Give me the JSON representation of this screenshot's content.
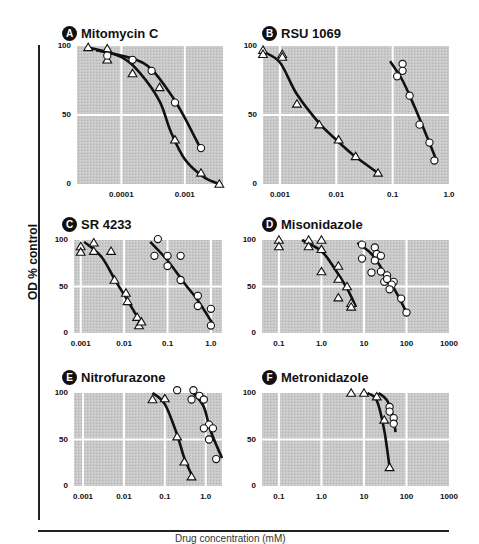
{
  "figure": {
    "y_axis_title": "OD % control",
    "x_axis_title": "Drug concentration (mM)"
  },
  "chart_data": [
    {
      "type": "line",
      "panel": "A",
      "title": "Mitomycin C",
      "xscale": "log",
      "xlim": [
        2e-05,
        0.004
      ],
      "ylim": [
        0,
        100
      ],
      "yticks": [
        "0",
        "50",
        "100"
      ],
      "xticks": [
        "0.0001",
        "0.001"
      ],
      "series": [
        {
          "name": "triangles",
          "marker": "triangle",
          "points": [
            [
              3e-05,
              99
            ],
            [
              6e-05,
              98
            ],
            [
              6e-05,
              90
            ],
            [
              0.00015,
              80
            ],
            [
              0.0004,
              70
            ],
            [
              0.0007,
              32
            ],
            [
              0.0018,
              8
            ],
            [
              0.0035,
              0
            ]
          ],
          "curve": [
            [
              3e-05,
              99
            ],
            [
              0.0001,
              92
            ],
            [
              0.0002,
              80
            ],
            [
              0.0004,
              60
            ],
            [
              0.0006,
              38
            ],
            [
              0.001,
              18
            ],
            [
              0.002,
              5
            ],
            [
              0.0035,
              0
            ]
          ]
        },
        {
          "name": "circles",
          "marker": "circle",
          "points": [
            [
              6e-05,
              93
            ],
            [
              0.00015,
              90
            ],
            [
              0.0003,
              82
            ],
            [
              0.0007,
              59
            ],
            [
              0.0018,
              26
            ]
          ],
          "curve": [
            [
              4e-05,
              97
            ],
            [
              0.00015,
              91
            ],
            [
              0.0003,
              83
            ],
            [
              0.0006,
              65
            ],
            [
              0.001,
              48
            ],
            [
              0.0018,
              25
            ]
          ]
        }
      ]
    },
    {
      "type": "line",
      "panel": "B",
      "title": "RSU 1069",
      "xscale": "log",
      "xlim": [
        0.0005,
        1.0
      ],
      "ylim": [
        0,
        100
      ],
      "yticks": [
        "0",
        "50",
        "100"
      ],
      "xticks": [
        "0.001",
        "0.01",
        "0.1",
        "1.0"
      ],
      "series": [
        {
          "name": "triangles",
          "marker": "triangle",
          "points": [
            [
              0.0005,
              97
            ],
            [
              0.0005,
              94
            ],
            [
              0.0011,
              94
            ],
            [
              0.0011,
              92
            ],
            [
              0.002,
              58
            ],
            [
              0.005,
              43
            ],
            [
              0.011,
              32
            ],
            [
              0.022,
              20
            ],
            [
              0.055,
              8
            ]
          ],
          "curve": [
            [
              0.0005,
              96
            ],
            [
              0.001,
              88
            ],
            [
              0.002,
              65
            ],
            [
              0.005,
              44
            ],
            [
              0.01,
              32
            ],
            [
              0.02,
              21
            ],
            [
              0.055,
              8
            ]
          ]
        },
        {
          "name": "circles",
          "marker": "circle",
          "points": [
            [
              0.12,
              78
            ],
            [
              0.15,
              87
            ],
            [
              0.15,
              82
            ],
            [
              0.2,
              64
            ],
            [
              0.3,
              43
            ],
            [
              0.45,
              30
            ],
            [
              0.55,
              17
            ]
          ],
          "curve": [
            [
              0.09,
              89
            ],
            [
              0.15,
              75
            ],
            [
              0.25,
              55
            ],
            [
              0.4,
              35
            ],
            [
              0.6,
              17
            ]
          ]
        }
      ]
    },
    {
      "type": "line",
      "panel": "C",
      "title": "SR 4233",
      "xscale": "log",
      "xlim": [
        0.0007,
        1.8
      ],
      "ylim": [
        0,
        100
      ],
      "yticks": [
        "0",
        "50",
        "100"
      ],
      "xticks": [
        "0.001",
        "0.01",
        "0.1",
        "1.0"
      ],
      "series": [
        {
          "name": "triangles",
          "marker": "triangle",
          "points": [
            [
              0.001,
              93
            ],
            [
              0.001,
              87
            ],
            [
              0.002,
              97
            ],
            [
              0.002,
              88
            ],
            [
              0.005,
              88
            ],
            [
              0.006,
              57
            ],
            [
              0.011,
              43
            ],
            [
              0.012,
              34
            ],
            [
              0.02,
              17
            ],
            [
              0.022,
              8
            ],
            [
              0.025,
              12
            ]
          ],
          "curve": [
            [
              0.0012,
              98
            ],
            [
              0.003,
              82
            ],
            [
              0.006,
              58
            ],
            [
              0.012,
              35
            ],
            [
              0.025,
              10
            ]
          ]
        },
        {
          "name": "circles",
          "marker": "circle",
          "points": [
            [
              0.06,
              101
            ],
            [
              0.05,
              83
            ],
            [
              0.1,
              83
            ],
            [
              0.1,
              72
            ],
            [
              0.2,
              83
            ],
            [
              0.2,
              57
            ],
            [
              0.5,
              40
            ],
            [
              0.5,
              29
            ],
            [
              1.0,
              26
            ],
            [
              1.0,
              8
            ]
          ],
          "curve": [
            [
              0.04,
              98
            ],
            [
              0.1,
              78
            ],
            [
              0.25,
              53
            ],
            [
              0.5,
              35
            ],
            [
              1.1,
              10
            ]
          ]
        }
      ]
    },
    {
      "type": "line",
      "panel": "D",
      "title": "Misonidazole",
      "xscale": "log",
      "xlim": [
        0.04,
        1000
      ],
      "ylim": [
        0,
        100
      ],
      "yticks": [
        "0",
        "50",
        "100"
      ],
      "xticks": [
        "0.1",
        "1.0",
        "10",
        "100",
        "1000"
      ],
      "series": [
        {
          "name": "triangles",
          "marker": "triangle",
          "points": [
            [
              0.1,
              100
            ],
            [
              0.1,
              93
            ],
            [
              0.5,
              100
            ],
            [
              0.5,
              93
            ],
            [
              1.0,
              100
            ],
            [
              1.0,
              90
            ],
            [
              1.0,
              66
            ],
            [
              2.5,
              72
            ],
            [
              2.5,
              58
            ],
            [
              4.0,
              50
            ],
            [
              2.5,
              38
            ],
            [
              5.0,
              32
            ],
            [
              5.0,
              28
            ]
          ],
          "curve": [
            [
              0.35,
              100
            ],
            [
              1.0,
              88
            ],
            [
              2.0,
              70
            ],
            [
              4.0,
              48
            ],
            [
              6.5,
              28
            ]
          ]
        },
        {
          "name": "circles",
          "marker": "circle",
          "points": [
            [
              9,
              95
            ],
            [
              18,
              92
            ],
            [
              20,
              85
            ],
            [
              25,
              83
            ],
            [
              9,
              80
            ],
            [
              18,
              78
            ],
            [
              25,
              66
            ],
            [
              15,
              65
            ],
            [
              35,
              62
            ],
            [
              30,
              55
            ],
            [
              50,
              55
            ],
            [
              35,
              58
            ],
            [
              45,
              52
            ],
            [
              40,
              47
            ],
            [
              75,
              37
            ],
            [
              100,
              22
            ]
          ],
          "curve": [
            [
              7,
              97
            ],
            [
              15,
              85
            ],
            [
              30,
              65
            ],
            [
              60,
              42
            ],
            [
              100,
              22
            ]
          ]
        }
      ]
    },
    {
      "type": "line",
      "panel": "E",
      "title": "Nitrofurazone",
      "xscale": "log",
      "xlim": [
        0.0006,
        2.5
      ],
      "ylim": [
        0,
        100
      ],
      "yticks": [
        "0",
        "50",
        "100"
      ],
      "xticks": [
        "0.001",
        "0.01",
        "0.1",
        "1.0"
      ],
      "series": [
        {
          "name": "triangles",
          "marker": "triangle",
          "points": [
            [
              0.05,
              93
            ],
            [
              0.1,
              94
            ],
            [
              0.2,
              53
            ],
            [
              0.3,
              26
            ],
            [
              0.45,
              10
            ]
          ],
          "curve": [
            [
              0.05,
              100
            ],
            [
              0.1,
              88
            ],
            [
              0.2,
              55
            ],
            [
              0.3,
              30
            ],
            [
              0.5,
              8
            ]
          ]
        },
        {
          "name": "circles",
          "marker": "circle",
          "points": [
            [
              0.2,
              103
            ],
            [
              0.5,
              103
            ],
            [
              0.45,
              93
            ],
            [
              0.7,
              97
            ],
            [
              0.9,
              93
            ],
            [
              1.2,
              66
            ],
            [
              0.9,
              62
            ],
            [
              1.5,
              62
            ],
            [
              1.2,
              50
            ],
            [
              1.8,
              29
            ]
          ],
          "curve": [
            [
              0.5,
              100
            ],
            [
              0.9,
              85
            ],
            [
              1.3,
              60
            ],
            [
              2.5,
              30
            ]
          ]
        }
      ]
    },
    {
      "type": "line",
      "panel": "F",
      "title": "Metronidazole",
      "xscale": "log",
      "xlim": [
        0.04,
        1000
      ],
      "ylim": [
        0,
        100
      ],
      "yticks": [
        "0",
        "50",
        "100"
      ],
      "xticks": [
        "0.1",
        "1.0",
        "10",
        "100",
        "1000"
      ],
      "series": [
        {
          "name": "triangles",
          "marker": "triangle",
          "points": [
            [
              5,
              100
            ],
            [
              10,
              100
            ],
            [
              20,
              96
            ],
            [
              30,
              71
            ],
            [
              40,
              20
            ]
          ],
          "curve": [
            [
              12,
              100
            ],
            [
              20,
              92
            ],
            [
              30,
              60
            ],
            [
              40,
              20
            ]
          ]
        },
        {
          "name": "circles",
          "marker": "circle",
          "points": [
            [
              40,
              85
            ],
            [
              40,
              80
            ],
            [
              50,
              73
            ],
            [
              50,
              67
            ]
          ],
          "curve": [
            [
              22,
              100
            ],
            [
              35,
              92
            ],
            [
              50,
              72
            ],
            [
              55,
              58
            ]
          ]
        }
      ]
    }
  ]
}
